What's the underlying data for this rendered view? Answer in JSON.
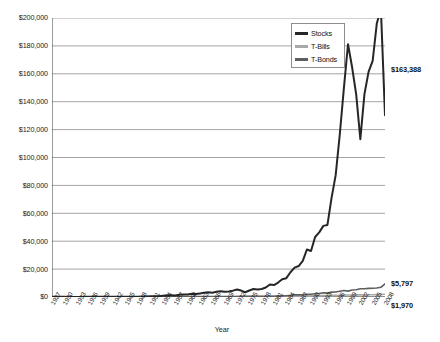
{
  "chart_data": {
    "type": "line",
    "title": "",
    "xlabel": "Year",
    "ylabel": "",
    "grid": true,
    "legend_position": "top-right",
    "ylim": [
      0,
      200000
    ],
    "ytick_values": [
      0,
      20000,
      40000,
      60000,
      80000,
      100000,
      120000,
      140000,
      160000,
      180000,
      200000
    ],
    "ytick_labels": [
      "$0",
      "$20,000",
      "$40,000",
      "$60,000",
      "$80,000",
      "$100,000",
      "$120,000",
      "$140,000",
      "$160,000",
      "$180,000",
      "$200,000"
    ],
    "x": [
      1927,
      1928,
      1929,
      1930,
      1931,
      1932,
      1933,
      1934,
      1935,
      1936,
      1937,
      1938,
      1939,
      1940,
      1941,
      1942,
      1943,
      1944,
      1945,
      1946,
      1947,
      1948,
      1949,
      1950,
      1951,
      1952,
      1953,
      1954,
      1955,
      1956,
      1957,
      1958,
      1959,
      1960,
      1961,
      1962,
      1963,
      1964,
      1965,
      1966,
      1967,
      1968,
      1969,
      1970,
      1971,
      1972,
      1973,
      1974,
      1975,
      1976,
      1977,
      1978,
      1979,
      1980,
      1981,
      1982,
      1983,
      1984,
      1985,
      1986,
      1987,
      1988,
      1989,
      1990,
      1991,
      1992,
      1993,
      1994,
      1995,
      1996,
      1997,
      1998,
      1999,
      2000,
      2001,
      2002,
      2003,
      2004,
      2005,
      2006,
      2007,
      2008
    ],
    "xtick_labels": [
      "1927",
      "1930",
      "1933",
      "1936",
      "1939",
      "1942",
      "1945",
      "1948",
      "1951",
      "1954",
      "1957",
      "1960",
      "1963",
      "1966",
      "1969",
      "1972",
      "1975",
      "1978",
      "1981",
      "1984",
      "1987",
      "1990",
      "1993",
      "1996",
      "1999",
      "2002",
      "2005",
      "2008"
    ],
    "xtick_step": 3,
    "series": [
      {
        "name": "Stocks",
        "color": "#262626",
        "width": 2.0,
        "values": [
          100,
          143,
          131,
          98,
          56,
          51,
          78,
          77,
          114,
          153,
          99,
          130,
          129,
          116,
          103,
          124,
          156,
          187,
          255,
          234,
          247,
          260,
          309,
          407,
          504,
          596,
          591,
          902,
          1187,
          1265,
          1129,
          1618,
          1812,
          1820,
          2308,
          2106,
          2586,
          3011,
          3387,
          3046,
          3776,
          4192,
          3836,
          3987,
          4555,
          5418,
          4623,
          3399,
          4664,
          5777,
          5364,
          5714,
          6771,
          8965,
          8525,
          10358,
          12693,
          13490,
          17765,
          21068,
          22177,
          25853,
          34040,
          32982,
          43035,
          46320,
          50975,
          51642,
          71024,
          87338,
          116474,
          149723,
          181198,
          164672,
          145112,
          113078,
          145452,
          161344,
          169242,
          195981,
          206722,
          130234
        ],
        "end_value": 163388,
        "end_label": "$163,388"
      },
      {
        "name": "T-Bonds",
        "color": "#5e5e5e",
        "width": 1.6,
        "values": [
          100,
          101,
          105,
          110,
          107,
          125,
          127,
          140,
          146,
          157,
          158,
          167,
          177,
          191,
          193,
          199,
          204,
          210,
          218,
          217,
          208,
          216,
          232,
          234,
          225,
          233,
          241,
          258,
          255,
          242,
          260,
          244,
          237,
          273,
          275,
          294,
          297,
          308,
          312,
          322,
          305,
          310,
          298,
          339,
          380,
          404,
          418,
          441,
          478,
          550,
          555,
          546,
          553,
          557,
          576,
          769,
          827,
          914,
          1216,
          1597,
          1502,
          1651,
          1961,
          2012,
          2332,
          2521,
          2991,
          2787,
          3494,
          3563,
          4081,
          4663,
          4213,
          4972,
          5194,
          5940,
          5949,
          6194,
          6240,
          6458,
          6969,
          9348
        ],
        "end_value": 5797,
        "end_label": "$5,797"
      },
      {
        "name": "T-Bills",
        "color": "#a9a9a9",
        "width": 1.6,
        "values": [
          100,
          103,
          108,
          112,
          113,
          114,
          114,
          114,
          114,
          114,
          115,
          115,
          115,
          115,
          115,
          115,
          116,
          116,
          116,
          116,
          117,
          118,
          119,
          120,
          122,
          124,
          126,
          127,
          129,
          133,
          137,
          139,
          143,
          147,
          150,
          154,
          159,
          164,
          170,
          178,
          185,
          194,
          207,
          221,
          230,
          239,
          256,
          275,
          291,
          304,
          320,
          342,
          377,
          419,
          478,
          533,
          579,
          631,
          673,
          720,
          758,
          808,
          872,
          925,
          978,
          1013,
          1043,
          1085,
          1146,
          1204,
          1267,
          1329,
          1389,
          1471,
          1528,
          1555,
          1571,
          1592,
          1640,
          1717,
          1805,
          1970
        ],
        "end_value": 1970,
        "end_label": "$1,970"
      }
    ]
  },
  "legend": {
    "items": [
      {
        "label": "Stocks",
        "color": "#262626"
      },
      {
        "label": "T-Bills",
        "color": "#a9a9a9"
      },
      {
        "label": "T-Bonds",
        "color": "#5e5e5e"
      }
    ]
  },
  "callouts": [
    {
      "name": "stocks-end-value",
      "text": "$163,388"
    },
    {
      "name": "tbonds-end-value",
      "text": "$5,797"
    },
    {
      "name": "tbills-end-value",
      "text": "$1,970"
    }
  ],
  "axes": {
    "x_title": "Year"
  }
}
